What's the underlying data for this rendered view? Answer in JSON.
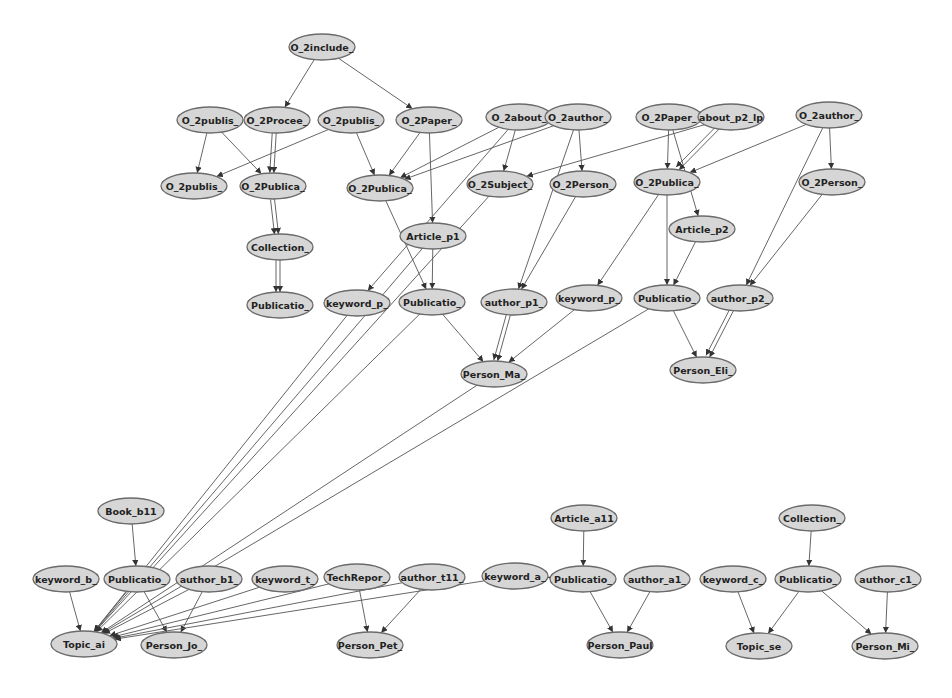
{
  "diagram": {
    "type": "directed-graph",
    "colors": {
      "node_fill": "#d6d6d6",
      "node_stroke": "#6a6a6a",
      "edge": "#555555",
      "text": "#222222",
      "background": "#ffffff"
    },
    "nodes": [
      {
        "id": "n0",
        "label": "O_2include_",
        "x": 322,
        "y": 47
      },
      {
        "id": "n1",
        "label": "O_2publis_",
        "x": 210,
        "y": 120
      },
      {
        "id": "n2",
        "label": "O_2Procee_",
        "x": 277,
        "y": 120
      },
      {
        "id": "n3",
        "label": "O_2publis_",
        "x": 351,
        "y": 120
      },
      {
        "id": "n4",
        "label": "O_2Paper_",
        "x": 429,
        "y": 120
      },
      {
        "id": "n5",
        "label": "O_2about_",
        "x": 519,
        "y": 117
      },
      {
        "id": "n6",
        "label": "O_2author_",
        "x": 578,
        "y": 117
      },
      {
        "id": "n7",
        "label": "O_2Paper_",
        "x": 669,
        "y": 117
      },
      {
        "id": "n8",
        "label": "about_p2_lp",
        "x": 731,
        "y": 117
      },
      {
        "id": "n9",
        "label": "O_2author_",
        "x": 829,
        "y": 115
      },
      {
        "id": "n10",
        "label": "O_2publis_",
        "x": 194,
        "y": 186
      },
      {
        "id": "n11",
        "label": "O_2Publica_",
        "x": 273,
        "y": 186
      },
      {
        "id": "n12",
        "label": "O_2Publica_",
        "x": 380,
        "y": 188
      },
      {
        "id": "n13",
        "label": "O_2Subject_",
        "x": 500,
        "y": 184
      },
      {
        "id": "n14",
        "label": "O_2Person_",
        "x": 583,
        "y": 184
      },
      {
        "id": "n15",
        "label": "O_2Publica_",
        "x": 667,
        "y": 182
      },
      {
        "id": "n16",
        "label": "O_2Person_",
        "x": 832,
        "y": 182
      },
      {
        "id": "n17",
        "label": "Collection_",
        "x": 280,
        "y": 247
      },
      {
        "id": "n18",
        "label": "Article_p1",
        "x": 433,
        "y": 236
      },
      {
        "id": "n19",
        "label": "Article_p2",
        "x": 702,
        "y": 229
      },
      {
        "id": "n20",
        "label": "Publicatio_",
        "x": 280,
        "y": 305
      },
      {
        "id": "n21",
        "label": "keyword_p_",
        "x": 357,
        "y": 303
      },
      {
        "id": "n22",
        "label": "Publicatio_",
        "x": 432,
        "y": 302
      },
      {
        "id": "n23",
        "label": "author_p1_",
        "x": 514,
        "y": 302
      },
      {
        "id": "n24",
        "label": "keyword_p_",
        "x": 589,
        "y": 298
      },
      {
        "id": "n25",
        "label": "Publicatio_",
        "x": 667,
        "y": 298
      },
      {
        "id": "n26",
        "label": "author_p2_",
        "x": 740,
        "y": 298
      },
      {
        "id": "n27",
        "label": "Person_Ma_",
        "x": 494,
        "y": 374
      },
      {
        "id": "n28",
        "label": "Person_Eli_",
        "x": 703,
        "y": 370
      },
      {
        "id": "n29",
        "label": "Book_b11",
        "x": 131,
        "y": 511
      },
      {
        "id": "n30",
        "label": "Article_a11",
        "x": 584,
        "y": 518
      },
      {
        "id": "n31",
        "label": "Collection_",
        "x": 812,
        "y": 518
      },
      {
        "id": "n32",
        "label": "keyword_b_",
        "x": 66,
        "y": 579
      },
      {
        "id": "n33",
        "label": "Publicatio_",
        "x": 137,
        "y": 579
      },
      {
        "id": "n34",
        "label": "author_b1_",
        "x": 209,
        "y": 579
      },
      {
        "id": "n35",
        "label": "keyword_t_",
        "x": 285,
        "y": 579
      },
      {
        "id": "n36",
        "label": "TechRepor_",
        "x": 357,
        "y": 577
      },
      {
        "id": "n37",
        "label": "author_t11_",
        "x": 432,
        "y": 577
      },
      {
        "id": "n38",
        "label": "keyword_a_",
        "x": 515,
        "y": 576
      },
      {
        "id": "n39",
        "label": "Publicatio_",
        "x": 583,
        "y": 579
      },
      {
        "id": "n40",
        "label": "author_a1_",
        "x": 657,
        "y": 579
      },
      {
        "id": "n41",
        "label": "keyword_c_",
        "x": 733,
        "y": 579
      },
      {
        "id": "n42",
        "label": "Publicatio_",
        "x": 808,
        "y": 579
      },
      {
        "id": "n43",
        "label": "author_c1_",
        "x": 888,
        "y": 579
      },
      {
        "id": "n44",
        "label": "Topic_ai",
        "x": 84,
        "y": 644
      },
      {
        "id": "n45",
        "label": "Person_Jo_",
        "x": 174,
        "y": 645
      },
      {
        "id": "n46",
        "label": "Person_Pet_",
        "x": 370,
        "y": 645
      },
      {
        "id": "n47",
        "label": "Person_Paul",
        "x": 620,
        "y": 645
      },
      {
        "id": "n48",
        "label": "Topic_se",
        "x": 759,
        "y": 646
      },
      {
        "id": "n49",
        "label": "Person_Mi_",
        "x": 885,
        "y": 646
      }
    ],
    "edges": [
      [
        "n0",
        "n2"
      ],
      [
        "n0",
        "n4"
      ],
      [
        "n1",
        "n10"
      ],
      [
        "n1",
        "n11"
      ],
      [
        "n2",
        "n11"
      ],
      [
        "n2",
        "n11"
      ],
      [
        "n3",
        "n10"
      ],
      [
        "n3",
        "n12"
      ],
      [
        "n4",
        "n12"
      ],
      [
        "n4",
        "n18"
      ],
      [
        "n5",
        "n12"
      ],
      [
        "n5",
        "n13"
      ],
      [
        "n5",
        "n21"
      ],
      [
        "n6",
        "n12"
      ],
      [
        "n6",
        "n14"
      ],
      [
        "n6",
        "n23"
      ],
      [
        "n7",
        "n15"
      ],
      [
        "n7",
        "n19"
      ],
      [
        "n8",
        "n15"
      ],
      [
        "n8",
        "n15"
      ],
      [
        "n8",
        "n13"
      ],
      [
        "n9",
        "n15"
      ],
      [
        "n9",
        "n16"
      ],
      [
        "n9",
        "n26"
      ],
      [
        "n11",
        "n17"
      ],
      [
        "n11",
        "n17"
      ],
      [
        "n17",
        "n20"
      ],
      [
        "n17",
        "n20"
      ],
      [
        "n12",
        "n22"
      ],
      [
        "n18",
        "n22"
      ],
      [
        "n13",
        "n44"
      ],
      [
        "n14",
        "n23"
      ],
      [
        "n15",
        "n24"
      ],
      [
        "n15",
        "n25"
      ],
      [
        "n19",
        "n25"
      ],
      [
        "n16",
        "n26"
      ],
      [
        "n22",
        "n27"
      ],
      [
        "n23",
        "n27"
      ],
      [
        "n23",
        "n27"
      ],
      [
        "n24",
        "n27"
      ],
      [
        "n25",
        "n28"
      ],
      [
        "n26",
        "n28"
      ],
      [
        "n26",
        "n28"
      ],
      [
        "n21",
        "n44"
      ],
      [
        "n22",
        "n44"
      ],
      [
        "n27",
        "n44"
      ],
      [
        "n25",
        "n44"
      ],
      [
        "n18",
        "n44"
      ],
      [
        "n29",
        "n33"
      ],
      [
        "n32",
        "n44"
      ],
      [
        "n33",
        "n44"
      ],
      [
        "n33",
        "n45"
      ],
      [
        "n34",
        "n45"
      ],
      [
        "n34",
        "n44"
      ],
      [
        "n35",
        "n44"
      ],
      [
        "n36",
        "n44"
      ],
      [
        "n36",
        "n46"
      ],
      [
        "n37",
        "n46"
      ],
      [
        "n37",
        "n44"
      ],
      [
        "n38",
        "n44"
      ],
      [
        "n30",
        "n39"
      ],
      [
        "n39",
        "n38"
      ],
      [
        "n39",
        "n47"
      ],
      [
        "n40",
        "n47"
      ],
      [
        "n31",
        "n42"
      ],
      [
        "n41",
        "n48"
      ],
      [
        "n42",
        "n48"
      ],
      [
        "n42",
        "n49"
      ],
      [
        "n43",
        "n49"
      ]
    ]
  }
}
